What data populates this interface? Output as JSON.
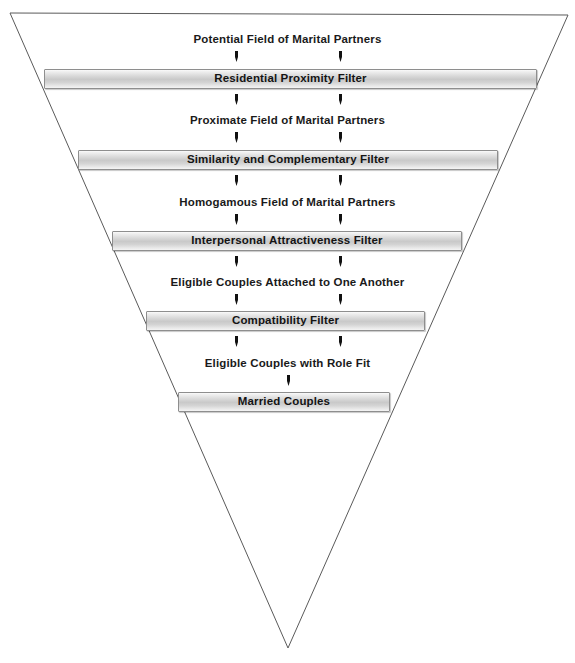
{
  "figure": {
    "name": "Filter Theory of Mate Selection funnel",
    "shape": "inverted-triangle",
    "outline_color": "#5a5a5a",
    "background_color": "#ffffff",
    "bar_fill_light": "#f4f4f4",
    "bar_fill_dark": "#c9c9c9",
    "bar_border_color": "#8e8e8e",
    "text_color": "#1a1a1a"
  },
  "stages": [
    {
      "id": "potential-field",
      "type": "label",
      "text": "Potential Field of Marital Partners",
      "top": 33,
      "arrows": 2
    },
    {
      "id": "residential-filter",
      "type": "filter",
      "text": "Residential Proximity Filter",
      "top": 69,
      "left": 44,
      "width": 493,
      "arrows": 2
    },
    {
      "id": "proximate-field",
      "type": "label",
      "text": "Proximate Field of Marital Partners",
      "top": 114,
      "arrows": 2
    },
    {
      "id": "similarity-filter",
      "type": "filter",
      "text": "Similarity and Complementary Filter",
      "top": 150,
      "left": 78,
      "width": 420,
      "arrows": 2
    },
    {
      "id": "homogamous-field",
      "type": "label",
      "text": "Homogamous Field of Marital Partners",
      "top": 196,
      "arrows": 2
    },
    {
      "id": "attractiveness-filter",
      "type": "filter",
      "text": "Interpersonal Attractiveness Filter",
      "top": 231,
      "left": 112,
      "width": 350,
      "arrows": 2
    },
    {
      "id": "eligible-attached",
      "type": "label",
      "text": "Eligible Couples Attached to One Another",
      "top": 276,
      "arrows": 2
    },
    {
      "id": "compatibility-filter",
      "type": "filter",
      "text": "Compatibility Filter",
      "top": 311,
      "left": 146,
      "width": 279,
      "arrows": 2
    },
    {
      "id": "eligible-role-fit",
      "type": "label",
      "text": "Eligible Couples with Role Fit",
      "top": 357,
      "arrows": 1
    },
    {
      "id": "married-couples",
      "type": "filter",
      "text": "Married Couples",
      "top": 392,
      "left": 178,
      "width": 212,
      "arrows": 0
    }
  ],
  "arrow_icon": "down-arrow-icon",
  "arrow_positions_pair": [
    236,
    340
  ],
  "arrow_positions_single": [
    288
  ]
}
